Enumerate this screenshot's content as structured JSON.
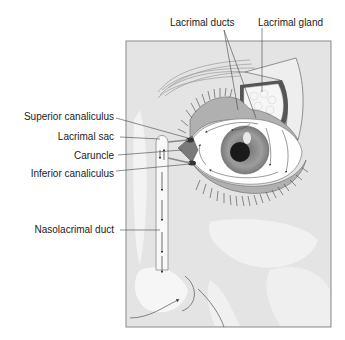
{
  "diagram": {
    "labels": {
      "lacrimal_ducts": "Lacrimal ducts",
      "lacrimal_gland": "Lacrimal gland",
      "superior_canaliculus": "Superior canaliculus",
      "lacrimal_sac": "Lacrimal sac",
      "caruncle": "Caruncle",
      "inferior_canaliculus": "Inferior canaliculus",
      "nasolacrimal_duct": "Nasolacrimal duct"
    },
    "colors": {
      "background": "#ffffff",
      "frame_fill": "#e4e4e4",
      "frame_border": "#8a8a8a",
      "skin_light": "#f2f2f2",
      "sclera": "#ffffff",
      "iris": "#9a9a9a",
      "pupil": "#1a1a1a",
      "eyelid": "#b5b5b5",
      "gland": "#f4f4f4",
      "text": "#222222",
      "leader": "#444444"
    }
  }
}
